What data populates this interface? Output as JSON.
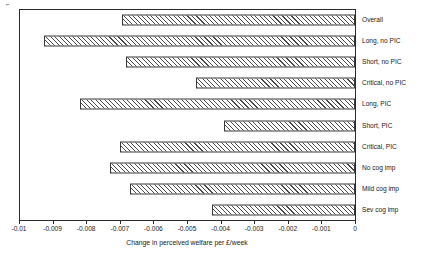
{
  "figure": {
    "corner_mark": "⌐"
  },
  "chart_data": {
    "type": "bar",
    "orientation": "horizontal",
    "title": "",
    "subtitle": "",
    "xlabel": "Change in perceived welfare per £/week",
    "ylabel": "",
    "xlim": [
      -0.01,
      0
    ],
    "ylim": null,
    "grid": false,
    "legend": null,
    "legend_position": "none",
    "bar_style": {
      "fill": "diagonal-hatch",
      "hatch_color": "#4a4a4a",
      "background": "#ffffff",
      "edge_color": "#3a3a3a"
    },
    "axis_color": "#2b2b2b",
    "xticks": [
      -0.01,
      -0.009,
      -0.008,
      -0.007,
      -0.006,
      -0.005,
      -0.004,
      -0.003,
      -0.002,
      -0.001,
      0
    ],
    "xticklabels": [
      "-0.01",
      "-0.009",
      "-0.008",
      "-0.007",
      "-0.006",
      "-0.005",
      "-0.004",
      "-0.003",
      "-0.002",
      "-0.001",
      "0"
    ],
    "categories": [
      "Overall",
      "Long, no PIC",
      "Short, no PIC",
      "Critical, no PIC",
      "Long, PIC",
      "Short, PIC",
      "Critical, PIC",
      "No cog imp",
      "Mild cog imp",
      "Sev cog imp"
    ],
    "values": [
      -0.00693,
      -0.00926,
      -0.00682,
      -0.00473,
      -0.00818,
      -0.0039,
      -0.00699,
      -0.00729,
      -0.0067,
      -0.00425
    ]
  }
}
